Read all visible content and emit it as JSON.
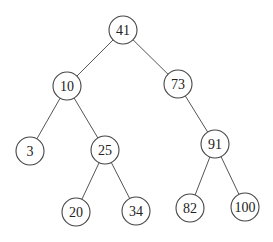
{
  "diagram": {
    "type": "binary-search-tree",
    "root": "41",
    "nodes": [
      {
        "id": "n41",
        "label": "41",
        "x": 123,
        "y": 30
      },
      {
        "id": "n10",
        "label": "10",
        "x": 67,
        "y": 86
      },
      {
        "id": "n73",
        "label": "73",
        "x": 178,
        "y": 84
      },
      {
        "id": "n3",
        "label": "3",
        "x": 30,
        "y": 151
      },
      {
        "id": "n25",
        "label": "25",
        "x": 105,
        "y": 150
      },
      {
        "id": "n91",
        "label": "91",
        "x": 215,
        "y": 144
      },
      {
        "id": "n20",
        "label": "20",
        "x": 76,
        "y": 212
      },
      {
        "id": "n34",
        "label": "34",
        "x": 136,
        "y": 211
      },
      {
        "id": "n82",
        "label": "82",
        "x": 190,
        "y": 208
      },
      {
        "id": "n100",
        "label": "100",
        "x": 245,
        "y": 207
      }
    ],
    "edges": [
      {
        "from": "n41",
        "to": "n10"
      },
      {
        "from": "n41",
        "to": "n73"
      },
      {
        "from": "n10",
        "to": "n3"
      },
      {
        "from": "n10",
        "to": "n25"
      },
      {
        "from": "n73",
        "to": "n91"
      },
      {
        "from": "n25",
        "to": "n20"
      },
      {
        "from": "n25",
        "to": "n34"
      },
      {
        "from": "n91",
        "to": "n82"
      },
      {
        "from": "n91",
        "to": "n100"
      }
    ],
    "node_radius": 14
  }
}
